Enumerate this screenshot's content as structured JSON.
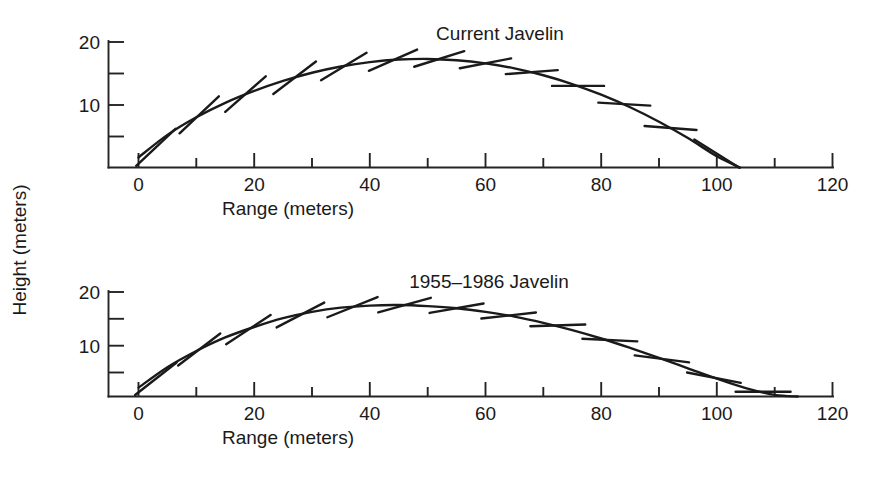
{
  "figure": {
    "shared_y_axis_label": "Height (meters)",
    "background_color": "#ffffff",
    "line_color": "#1a1a1a"
  },
  "chart_data": [
    {
      "type": "line",
      "title": "Current Javelin",
      "xlabel": "Range (meters)",
      "ylabel": "Height (meters)",
      "xlim": [
        0,
        120
      ],
      "ylim": [
        0,
        22
      ],
      "xticks": [
        0,
        20,
        40,
        60,
        80,
        100,
        120
      ],
      "xticklabels": [
        "0",
        "20",
        "40",
        "60",
        "80",
        "100",
        "120"
      ],
      "xminorticks": [
        10,
        30,
        50,
        70,
        90,
        110
      ],
      "yticks": [
        10,
        20
      ],
      "yticklabels": [
        "10",
        "20"
      ],
      "yminorticks": [
        5,
        15
      ],
      "grid": false,
      "legend": "none",
      "series": [
        {
          "name": "Current Javelin trajectory",
          "x": [
            0,
            5,
            10,
            15,
            20,
            25,
            30,
            35,
            40,
            45,
            50,
            55,
            60,
            65,
            70,
            75,
            80,
            85,
            90,
            95,
            100,
            104
          ],
          "y": [
            1.6,
            5.2,
            8.0,
            10.3,
            12.2,
            13.8,
            15.1,
            16.1,
            16.8,
            17.2,
            17.3,
            17.1,
            16.6,
            15.8,
            14.7,
            13.3,
            11.6,
            9.6,
            7.3,
            4.7,
            1.8,
            0.0
          ]
        }
      ],
      "javelin_attitude_marks": {
        "description": "Short straight segments drawn through the trajectory showing javelin angle of attack along the flight",
        "units": "range_meters, height_meters, angle_degrees_from_horizontal, length_meters",
        "marks": [
          {
            "x": 3.0,
            "y": 3.2,
            "angle": 41,
            "length": 9.0
          },
          {
            "x": 10.5,
            "y": 8.4,
            "angle": 41,
            "length": 9.0
          },
          {
            "x": 18.5,
            "y": 11.7,
            "angle": 39,
            "length": 9.0
          },
          {
            "x": 27.0,
            "y": 14.3,
            "angle": 35,
            "length": 9.0
          },
          {
            "x": 35.5,
            "y": 16.1,
            "angle": 29,
            "length": 9.0
          },
          {
            "x": 44.0,
            "y": 17.1,
            "angle": 22,
            "length": 9.0
          },
          {
            "x": 52.0,
            "y": 17.3,
            "angle": 16,
            "length": 9.0
          },
          {
            "x": 60.0,
            "y": 16.6,
            "angle": 10,
            "length": 9.0
          },
          {
            "x": 68.0,
            "y": 15.2,
            "angle": 4,
            "length": 9.0
          },
          {
            "x": 76.0,
            "y": 13.0,
            "angle": 0,
            "length": 9.0
          },
          {
            "x": 84.0,
            "y": 10.1,
            "angle": -3,
            "length": 9.0
          },
          {
            "x": 92.0,
            "y": 6.3,
            "angle": -4,
            "length": 9.0
          },
          {
            "x": 100.0,
            "y": 2.2,
            "angle": -30,
            "length": 9.0
          }
        ]
      },
      "annotations": [
        {
          "text": "Current Javelin",
          "x": 62,
          "y": 23.5
        }
      ]
    },
    {
      "type": "line",
      "title": "1955–1986 Javelin",
      "xlabel": "Range (meters)",
      "ylabel": "Height (meters)",
      "xlim": [
        0,
        120
      ],
      "ylim": [
        0,
        22
      ],
      "xticks": [
        0,
        20,
        40,
        60,
        80,
        100,
        120
      ],
      "xticklabels": [
        "0",
        "20",
        "40",
        "60",
        "80",
        "100",
        "120"
      ],
      "xminorticks": [
        10,
        30,
        50,
        70,
        90,
        110
      ],
      "yticks": [
        10,
        20
      ],
      "yticklabels": [
        "10",
        "20"
      ],
      "yminorticks": [
        5,
        15
      ],
      "grid": false,
      "legend": "none",
      "series": [
        {
          "name": "1955–1986 Javelin trajectory",
          "x": [
            0,
            5,
            10,
            15,
            20,
            25,
            30,
            35,
            40,
            45,
            50,
            55,
            60,
            65,
            70,
            75,
            80,
            85,
            90,
            95,
            100,
            105,
            110,
            114
          ],
          "y": [
            1.7,
            5.6,
            8.7,
            11.3,
            13.3,
            15.0,
            16.2,
            17.0,
            17.4,
            17.5,
            17.3,
            16.9,
            16.2,
            15.3,
            14.1,
            12.7,
            11.1,
            9.3,
            7.4,
            5.4,
            3.4,
            1.6,
            0.3,
            0.0
          ]
        }
      ],
      "javelin_attitude_marks": {
        "description": "Short straight segments drawn through the trajectory showing javelin angle of attack along the flight",
        "units": "range_meters, height_meters, angle_degrees_from_horizontal, length_meters",
        "marks": [
          {
            "x": 3.0,
            "y": 3.4,
            "angle": 41,
            "length": 9.5
          },
          {
            "x": 10.5,
            "y": 9.0,
            "angle": 40,
            "length": 9.5
          },
          {
            "x": 19.0,
            "y": 12.8,
            "angle": 36,
            "length": 9.5
          },
          {
            "x": 28.0,
            "y": 15.6,
            "angle": 30,
            "length": 9.5
          },
          {
            "x": 37.0,
            "y": 17.1,
            "angle": 24,
            "length": 9.5
          },
          {
            "x": 46.0,
            "y": 17.5,
            "angle": 17,
            "length": 9.5
          },
          {
            "x": 55.0,
            "y": 16.9,
            "angle": 11,
            "length": 9.5
          },
          {
            "x": 64.0,
            "y": 15.5,
            "angle": 7,
            "length": 9.5
          },
          {
            "x": 72.5,
            "y": 13.6,
            "angle": 2,
            "length": 9.5
          },
          {
            "x": 81.5,
            "y": 10.8,
            "angle": -3,
            "length": 9.5
          },
          {
            "x": 90.5,
            "y": 7.2,
            "angle": -8,
            "length": 9.5
          },
          {
            "x": 99.5,
            "y": 3.6,
            "angle": -12,
            "length": 9.5
          },
          {
            "x": 108.0,
            "y": 0.9,
            "angle": 0,
            "length": 9.5
          }
        ]
      },
      "annotations": [
        {
          "text": "1955–1986 Javelin",
          "x": 60,
          "y": 23.5
        }
      ]
    }
  ],
  "panels": [
    {
      "title": "Current Javelin",
      "xlabel": "Range (meters)",
      "xticklabels": [
        "0",
        "20",
        "40",
        "60",
        "80",
        "100",
        "120"
      ],
      "yticklabels": [
        "20",
        "10"
      ]
    },
    {
      "title": "1955–1986 Javelin",
      "xlabel": "Range (meters)",
      "xticklabels": [
        "0",
        "20",
        "40",
        "60",
        "80",
        "100",
        "120"
      ],
      "yticklabels": [
        "20",
        "10"
      ]
    }
  ]
}
